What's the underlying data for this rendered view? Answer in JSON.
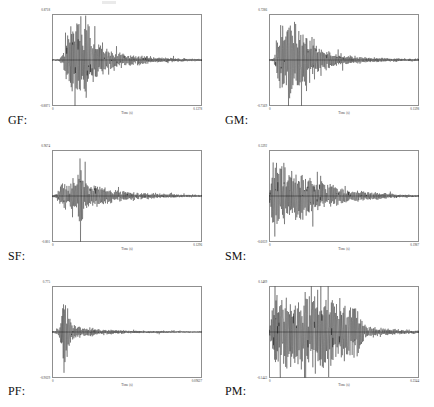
{
  "figure": {
    "panel_count": 6,
    "axis_caption": "Time (s)",
    "columns": 2,
    "rows": 3,
    "background_color": "#ffffff",
    "trace_color": "#000000",
    "frame_color": "#8f8f8f"
  },
  "chart_data": {
    "type": "line",
    "title": "",
    "xlabel": "Time (s)",
    "ylabel": "",
    "grid": false,
    "legend": "none",
    "panels": [
      {
        "label": "GF:",
        "position": "row1-col1",
        "xlabel": "Time (s)",
        "xlim": [
          0,
          0.1378
        ],
        "ylim": [
          -0.8871,
          0.8718
        ],
        "x_tick_labels": [
          "0",
          "0.1378"
        ],
        "y_tick_labels": [
          "0.8718",
          "-0.8871"
        ],
        "envelope_note": "burst onset near t=0.10 of span, three tall peaks, slow decay to baseline",
        "envelope": [
          [
            0.0,
            0.01
          ],
          [
            0.04,
            0.02
          ],
          [
            0.07,
            0.1
          ],
          [
            0.09,
            0.42
          ],
          [
            0.11,
            0.55
          ],
          [
            0.13,
            0.72
          ],
          [
            0.15,
            0.55
          ],
          [
            0.17,
            0.92
          ],
          [
            0.19,
            0.6
          ],
          [
            0.21,
            0.48
          ],
          [
            0.23,
            0.98
          ],
          [
            0.25,
            0.66
          ],
          [
            0.27,
            0.52
          ],
          [
            0.3,
            0.4
          ],
          [
            0.33,
            0.33
          ],
          [
            0.36,
            0.27
          ],
          [
            0.4,
            0.22
          ],
          [
            0.45,
            0.17
          ],
          [
            0.5,
            0.13
          ],
          [
            0.56,
            0.1
          ],
          [
            0.62,
            0.08
          ],
          [
            0.68,
            0.06
          ],
          [
            0.75,
            0.05
          ],
          [
            0.82,
            0.04
          ],
          [
            0.9,
            0.03
          ],
          [
            1.0,
            0.02
          ]
        ]
      },
      {
        "label": "GM:",
        "position": "row1-col2",
        "xlabel": "Time (s)",
        "xlim": [
          0,
          0.1598
        ],
        "ylim": [
          -0.7569,
          0.7286
        ],
        "x_tick_labels": [
          "0",
          "0.1598"
        ],
        "y_tick_labels": [
          "0.7286",
          "-0.7569"
        ],
        "envelope_note": "dense sustained burst from t=0.05 to 0.30 then decay",
        "envelope": [
          [
            0.0,
            0.01
          ],
          [
            0.03,
            0.04
          ],
          [
            0.05,
            0.3
          ],
          [
            0.07,
            0.62
          ],
          [
            0.09,
            0.78
          ],
          [
            0.11,
            0.7
          ],
          [
            0.13,
            0.95
          ],
          [
            0.15,
            0.72
          ],
          [
            0.17,
            0.85
          ],
          [
            0.19,
            0.62
          ],
          [
            0.21,
            0.74
          ],
          [
            0.23,
            0.55
          ],
          [
            0.25,
            0.68
          ],
          [
            0.27,
            0.45
          ],
          [
            0.29,
            0.5
          ],
          [
            0.32,
            0.3
          ],
          [
            0.35,
            0.22
          ],
          [
            0.38,
            0.18
          ],
          [
            0.42,
            0.14
          ],
          [
            0.47,
            0.11
          ],
          [
            0.53,
            0.09
          ],
          [
            0.6,
            0.07
          ],
          [
            0.68,
            0.05
          ],
          [
            0.78,
            0.04
          ],
          [
            0.88,
            0.03
          ],
          [
            1.0,
            0.02
          ]
        ]
      },
      {
        "label": "SF:",
        "position": "row2-col1",
        "xlabel": "Time (s)",
        "xlim": [
          0,
          0.1296
        ],
        "ylim": [
          -0.801,
          0.9674
        ],
        "x_tick_labels": [
          "0",
          "0.1296"
        ],
        "y_tick_labels": [
          "0.9674",
          "-0.801"
        ],
        "envelope_note": "moderate onset then one dominant spike near t=0.20, gradual decay",
        "envelope": [
          [
            0.0,
            0.01
          ],
          [
            0.03,
            0.05
          ],
          [
            0.05,
            0.16
          ],
          [
            0.07,
            0.26
          ],
          [
            0.09,
            0.3
          ],
          [
            0.11,
            0.24
          ],
          [
            0.13,
            0.34
          ],
          [
            0.15,
            0.28
          ],
          [
            0.17,
            0.4
          ],
          [
            0.19,
            1.0
          ],
          [
            0.21,
            0.44
          ],
          [
            0.23,
            0.36
          ],
          [
            0.25,
            0.3
          ],
          [
            0.28,
            0.25
          ],
          [
            0.31,
            0.21
          ],
          [
            0.35,
            0.17
          ],
          [
            0.4,
            0.13
          ],
          [
            0.46,
            0.1
          ],
          [
            0.52,
            0.08
          ],
          [
            0.6,
            0.06
          ],
          [
            0.68,
            0.05
          ],
          [
            0.78,
            0.04
          ],
          [
            0.88,
            0.03
          ],
          [
            1.0,
            0.02
          ]
        ]
      },
      {
        "label": "SM:",
        "position": "row2-col2",
        "xlabel": "Time (s)",
        "xlim": [
          0,
          0.1987
        ],
        "ylim": [
          -0.6059,
          0.5392
        ],
        "x_tick_labels": [
          "0",
          "0.1987"
        ],
        "y_tick_labels": [
          "0.5392",
          "-0.6059"
        ],
        "envelope_note": "sharp onset at left edge, highest peak at t=0.04, long smooth decay",
        "envelope": [
          [
            0.0,
            0.02
          ],
          [
            0.02,
            0.55
          ],
          [
            0.04,
            1.0
          ],
          [
            0.06,
            0.7
          ],
          [
            0.08,
            0.52
          ],
          [
            0.1,
            0.58
          ],
          [
            0.12,
            0.46
          ],
          [
            0.14,
            0.5
          ],
          [
            0.16,
            0.42
          ],
          [
            0.18,
            0.52
          ],
          [
            0.2,
            0.44
          ],
          [
            0.23,
            0.46
          ],
          [
            0.26,
            0.38
          ],
          [
            0.29,
            0.4
          ],
          [
            0.32,
            0.33
          ],
          [
            0.36,
            0.28
          ],
          [
            0.4,
            0.24
          ],
          [
            0.45,
            0.19
          ],
          [
            0.5,
            0.16
          ],
          [
            0.56,
            0.13
          ],
          [
            0.62,
            0.1
          ],
          [
            0.7,
            0.08
          ],
          [
            0.78,
            0.06
          ],
          [
            0.86,
            0.04
          ],
          [
            1.0,
            0.02
          ]
        ]
      },
      {
        "label": "PF:",
        "position": "row3-col1",
        "xlabel": "Time (s)",
        "xlim": [
          0,
          0.09627
        ],
        "ylim": [
          -0.9029,
          0.775
        ],
        "x_tick_labels": [
          "0",
          "0.09627"
        ],
        "y_tick_labels": [
          "0.775",
          "-0.9029"
        ],
        "envelope_note": "single very narrow transient near t=0.09 then fast decay to near-zero tail",
        "envelope": [
          [
            0.0,
            0.01
          ],
          [
            0.03,
            0.04
          ],
          [
            0.05,
            0.12
          ],
          [
            0.07,
            0.45
          ],
          [
            0.08,
            0.88
          ],
          [
            0.09,
            1.0
          ],
          [
            0.1,
            0.8
          ],
          [
            0.11,
            0.4
          ],
          [
            0.13,
            0.22
          ],
          [
            0.15,
            0.16
          ],
          [
            0.17,
            0.13
          ],
          [
            0.2,
            0.11
          ],
          [
            0.24,
            0.09
          ],
          [
            0.28,
            0.08
          ],
          [
            0.33,
            0.06
          ],
          [
            0.38,
            0.05
          ],
          [
            0.45,
            0.04
          ],
          [
            0.52,
            0.03
          ],
          [
            0.62,
            0.025
          ],
          [
            0.75,
            0.02
          ],
          [
            0.88,
            0.015
          ],
          [
            1.0,
            0.01
          ]
        ]
      },
      {
        "label": "PM:",
        "position": "row3-col2",
        "xlabel": "Time (s)",
        "xlim": [
          0,
          0.2344
        ],
        "ylim": [
          -0.1443,
          0.1489
        ],
        "x_tick_labels": [
          "0",
          "0.2344"
        ],
        "y_tick_labels": [
          "0.1489",
          "-0.1443"
        ],
        "envelope_note": "long sustained high-amplitude train from t=0.02 to 0.62 with abrupt cutoff then small tail",
        "envelope": [
          [
            0.0,
            0.03
          ],
          [
            0.02,
            0.5
          ],
          [
            0.04,
            0.92
          ],
          [
            0.06,
            0.7
          ],
          [
            0.08,
            0.8
          ],
          [
            0.1,
            0.6
          ],
          [
            0.12,
            0.72
          ],
          [
            0.14,
            0.55
          ],
          [
            0.16,
            0.66
          ],
          [
            0.18,
            0.58
          ],
          [
            0.2,
            0.7
          ],
          [
            0.22,
            0.6
          ],
          [
            0.25,
            0.78
          ],
          [
            0.28,
            0.64
          ],
          [
            0.31,
            0.88
          ],
          [
            0.34,
            0.66
          ],
          [
            0.37,
            0.8
          ],
          [
            0.4,
            0.62
          ],
          [
            0.43,
            0.74
          ],
          [
            0.46,
            0.58
          ],
          [
            0.49,
            0.66
          ],
          [
            0.52,
            0.54
          ],
          [
            0.55,
            0.6
          ],
          [
            0.58,
            0.7
          ],
          [
            0.6,
            0.48
          ],
          [
            0.62,
            0.3
          ],
          [
            0.64,
            0.16
          ],
          [
            0.67,
            0.12
          ],
          [
            0.7,
            0.1
          ],
          [
            0.74,
            0.08
          ],
          [
            0.78,
            0.07
          ],
          [
            0.83,
            0.06
          ],
          [
            0.88,
            0.05
          ],
          [
            0.94,
            0.04
          ],
          [
            1.0,
            0.03
          ]
        ]
      }
    ]
  }
}
